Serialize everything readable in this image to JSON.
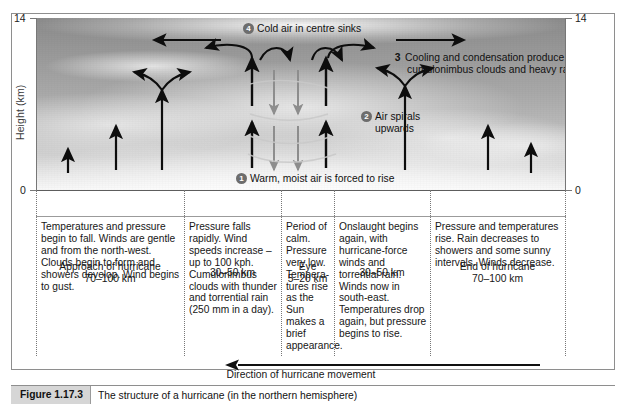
{
  "figure": {
    "label": "Figure 1.17.3",
    "caption": "The structure of a hurricane (in the northern hemisphere)"
  },
  "axis": {
    "y_title": "Height (km)",
    "top_tick_left": "14",
    "top_tick_right": "14",
    "bottom_tick_left": "0",
    "bottom_tick_right": "0"
  },
  "callouts": [
    {
      "number": "1",
      "text": "Warm, moist air is forced to rise",
      "style": "circle"
    },
    {
      "number": "2",
      "text": "Air spirals",
      "text2": "upwards",
      "style": "circle"
    },
    {
      "number": "3",
      "text": "Cooling and condensation produce",
      "text2": "cumulonimbus clouds and heavy rain",
      "style": "plain"
    },
    {
      "number": "4",
      "text": "Cold air in centre sinks",
      "style": "circle"
    }
  ],
  "table": {
    "headers": [
      {
        "line1": "Approach of hurricane",
        "line2": "70–100 km"
      },
      {
        "line1": "30–50 km",
        "line2": ""
      },
      {
        "line1": "Eye",
        "line2": "5–20 km"
      },
      {
        "line1": "30–50 km",
        "line2": ""
      },
      {
        "line1": "End of hurricane",
        "line2": "70–100 km"
      }
    ],
    "cells": [
      "Temperatures and pressure begin to fall. Winds are gentle and from the north-west. Clouds begin to form and showers develop. Wind begins to gust.",
      "Pressure falls rapidly. Wind speeds increase – up to 100 kph. Cumulonimbus clouds with thunder and torrential rain (250 mm in a day).",
      "Period of calm. Pressure very low. Tempera-tures rise as the Sun makes a brief appearance.",
      "Onslaught begins again, with hurricane-force winds and torrential rain. Winds now in south-east. Temperatures drop again, but pressure begins to rise.",
      "Pressure and temperatures rise. Rain decreases to showers and some sunny intervals. Winds decrease."
    ]
  },
  "direction": {
    "text": "Direction of hurricane movement",
    "arrow": "left-arrow-icon"
  },
  "colors": {
    "frame": "#8e8e8e",
    "badge": "#6d6d6d",
    "caption_tab": "#d6d6d6",
    "ink": "#111111"
  }
}
